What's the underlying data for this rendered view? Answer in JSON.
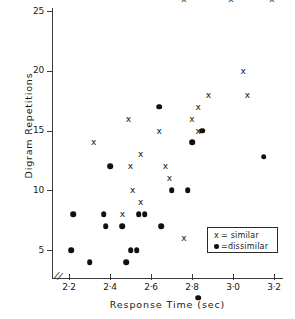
{
  "chart_data": {
    "type": "scatter",
    "title": "",
    "xlabel": "Response Time   (sec)",
    "ylabel": "Digram Repetitions",
    "xlim": [
      2.15,
      3.25
    ],
    "ylim": [
      0,
      26.5
    ],
    "xticks": [
      "2·2",
      "2·4",
      "2·6",
      "2·8",
      "3·0",
      "3·2"
    ],
    "xtick_values": [
      2.2,
      2.4,
      2.6,
      2.8,
      3.0,
      3.2
    ],
    "yticks": [
      "25",
      "20",
      "15",
      "10",
      "5"
    ],
    "ytick_values": [
      25,
      20,
      15,
      10,
      5
    ],
    "grid": false,
    "axis_break_x": true,
    "legend_position": "lower-right",
    "series": [
      {
        "name": "similar",
        "marker": "x",
        "legend_label": "x = similar",
        "color": "#111111",
        "points": [
          [
            2.76,
            26.0
          ],
          [
            2.99,
            26.0
          ],
          [
            3.19,
            26.0
          ],
          [
            3.05,
            20.0
          ],
          [
            2.88,
            18.0
          ],
          [
            3.07,
            18.0
          ],
          [
            2.83,
            17.0
          ],
          [
            2.49,
            16.0
          ],
          [
            2.8,
            16.0
          ],
          [
            2.64,
            15.0
          ],
          [
            2.83,
            15.0
          ],
          [
            2.32,
            14.0
          ],
          [
            2.55,
            13.0
          ],
          [
            2.5,
            12.0
          ],
          [
            2.67,
            12.0
          ],
          [
            2.69,
            11.0
          ],
          [
            2.51,
            10.0
          ],
          [
            2.55,
            9.0
          ],
          [
            2.46,
            8.0
          ],
          [
            2.76,
            6.0
          ]
        ]
      },
      {
        "name": "dissimilar",
        "marker": "dot",
        "legend_label": "●=dissimilar",
        "color": "#111111",
        "points": [
          [
            2.64,
            17.0
          ],
          [
            2.85,
            15.0
          ],
          [
            2.8,
            14.0
          ],
          [
            3.15,
            12.8
          ],
          [
            2.4,
            12.0
          ],
          [
            2.7,
            10.0
          ],
          [
            2.78,
            10.0
          ],
          [
            2.22,
            8.0
          ],
          [
            2.37,
            8.0
          ],
          [
            2.54,
            8.0
          ],
          [
            2.57,
            8.0
          ],
          [
            2.38,
            7.0
          ],
          [
            2.46,
            7.0
          ],
          [
            2.65,
            7.0
          ],
          [
            2.21,
            5.0
          ],
          [
            2.5,
            5.0
          ],
          [
            2.53,
            5.0
          ],
          [
            2.3,
            4.0
          ],
          [
            2.48,
            4.0
          ],
          [
            2.83,
            1.0
          ]
        ]
      }
    ]
  },
  "legend": {
    "similar": {
      "symbol": "x",
      "text": "= similar"
    },
    "dissimilar": {
      "symbol": "●",
      "text": "=dissimilar"
    }
  },
  "axis": {
    "break_glyph": "//"
  }
}
